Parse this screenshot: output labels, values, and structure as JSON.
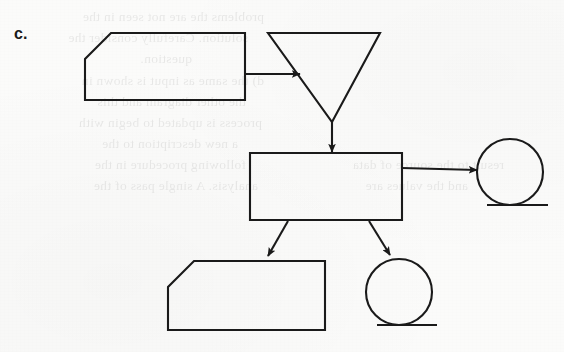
{
  "figure": {
    "label": "c.",
    "background_color": "#fbfbfa",
    "ink_color": "#1a1a1a"
  },
  "background_bleed_text": [
    {
      "text": "problems the are not seen in the",
      "x": 300,
      "y": 6
    },
    {
      "text": "solution. Carefully consider the",
      "x": 316,
      "y": 27
    },
    {
      "text": "question.",
      "x": 372,
      "y": 48
    },
    {
      "text": "d) the same as input is shown in",
      "x": 300,
      "y": 70
    },
    {
      "text": "the other diagram and this",
      "x": 318,
      "y": 91
    },
    {
      "text": "process is updated to begin with",
      "x": 302,
      "y": 112
    },
    {
      "text": "a new description to the",
      "x": 326,
      "y": 133
    },
    {
      "text": "following procedure in the",
      "x": 318,
      "y": 154
    },
    {
      "text": "analysis. A single pass of the",
      "x": 306,
      "y": 175
    },
    {
      "text": "result to the source of data",
      "x": 60,
      "y": 154
    },
    {
      "text": "and the values are",
      "x": 96,
      "y": 175
    }
  ],
  "chart_data": {
    "type": "diagram",
    "title": "c.",
    "diagram_kind": "flowchart",
    "nodes": [
      {
        "id": "input-top-left",
        "name": "manual-input-shape",
        "shape": "cut-corner-rectangle",
        "label": "",
        "x": 85,
        "y": 33,
        "width": 160,
        "height": 67,
        "corner_cut": "top-left",
        "corner_cut_size": 26
      },
      {
        "id": "extract-triangle",
        "name": "inverted-triangle-shape",
        "shape": "inverted-triangle",
        "label": "",
        "x": 268,
        "y": 33,
        "width": 112,
        "height": 88
      },
      {
        "id": "process-rectangle",
        "name": "process-rectangle-shape",
        "shape": "rectangle",
        "label": "",
        "x": 250,
        "y": 153,
        "width": 152,
        "height": 67
      },
      {
        "id": "connector-right",
        "name": "collate-circle-shape",
        "shape": "circle-with-tangent-line",
        "label": "",
        "cx": 510,
        "cy": 172,
        "r": 33,
        "tangent": {
          "x1": 487,
          "y1": 205,
          "x2": 548,
          "y2": 205
        }
      },
      {
        "id": "input-bottom-left",
        "name": "manual-input-shape",
        "shape": "cut-corner-rectangle",
        "label": "",
        "x": 168,
        "y": 261,
        "width": 157,
        "height": 69,
        "corner_cut": "top-left",
        "corner_cut_size": 26
      },
      {
        "id": "connector-bottom",
        "name": "collate-circle-shape",
        "shape": "circle-with-tangent-line",
        "label": "",
        "cx": 399,
        "cy": 292,
        "r": 33,
        "tangent": {
          "x1": 377,
          "y1": 325,
          "x2": 437,
          "y2": 325
        }
      }
    ],
    "edges": [
      {
        "from": "input-top-left",
        "to": "extract-triangle",
        "style": "straight-arrow",
        "direction": "right"
      },
      {
        "from": "extract-triangle",
        "to": "process-rectangle",
        "style": "straight-arrow",
        "direction": "down"
      },
      {
        "from": "process-rectangle",
        "to": "connector-right",
        "style": "straight-arrow",
        "direction": "right"
      },
      {
        "from": "process-rectangle",
        "to": "input-bottom-left",
        "style": "straight-arrow",
        "direction": "down-left"
      },
      {
        "from": "process-rectangle",
        "to": "connector-bottom",
        "style": "straight-arrow",
        "direction": "down-right"
      }
    ]
  }
}
